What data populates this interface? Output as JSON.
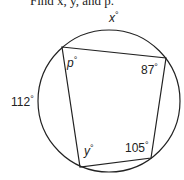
{
  "prompt": "Find x, y, and p.",
  "figure": {
    "type": "cyclic-quadrilateral-in-circle",
    "labels": {
      "arc_top": {
        "var": "x",
        "unit": "°"
      },
      "arc_left": {
        "value": "112",
        "unit": "°"
      },
      "angle_top_left": {
        "var": "p",
        "unit": "°"
      },
      "angle_top_right": {
        "value": "87",
        "unit": "°"
      },
      "angle_bottom_right": {
        "value": "105",
        "unit": "°"
      },
      "angle_bottom_left": {
        "var": "y",
        "unit": "°"
      }
    },
    "colors": {
      "stroke": "#222222",
      "background": "#ffffff"
    }
  }
}
